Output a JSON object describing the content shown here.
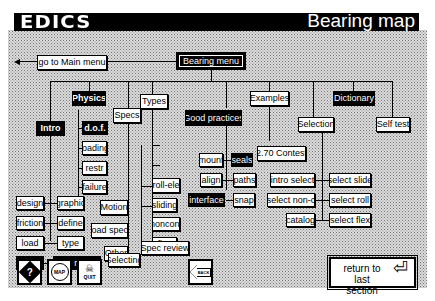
{
  "header": {
    "logo": "EDICS",
    "title": "Bearing map"
  },
  "nav": {
    "main_menu": "go to Main menu",
    "bearing_menu": "Bearing menu"
  },
  "nodes": {
    "intro": "Intro",
    "physics": "Physics",
    "dof": "d.o.f.",
    "loading": "loading",
    "restr": "restr",
    "failure": "failure",
    "design": "design",
    "graphic": "graphic",
    "friction": "friction",
    "define": "define",
    "load": "load",
    "type": "type",
    "find": "find",
    "intro_review": "Intro  review",
    "specs": "Specs",
    "motion": "Motion",
    "load_specs": "Load specs",
    "other": "Other",
    "selecting": "Selecting",
    "types": "Types",
    "roll_ele": "roll-ele",
    "sliding": "sliding",
    "noncont": "noncont",
    "flex": "flex",
    "spec_review": "Spec  review",
    "good_practices": "Good practices",
    "mount": "mount",
    "seals": "seals",
    "align": "align",
    "paths": "paths",
    "interface": "interface",
    "snap": "snap",
    "examples": "Examples",
    "contest": "2.70  Contest",
    "selection": "Selection",
    "intro_select": "intro  select",
    "select_non_c": "select  non-c",
    "catalog": "catalog",
    "select_slide": "select  slide",
    "select_roll": "select  roll",
    "select_flex": "select  flex",
    "dictionary": "Dictionary",
    "self_test": "Self  test"
  },
  "toolbar": {
    "help_icon": "?",
    "map_label": "MAP",
    "quit_label": "QUIT",
    "back_label": "BACK",
    "return_line1": "return to",
    "return_line2": "last section",
    "return_glyph": "⏎"
  }
}
